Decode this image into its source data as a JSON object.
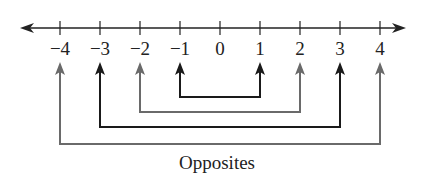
{
  "diagram": {
    "title": "",
    "number_line": {
      "ticks": [
        "−4",
        "−3",
        "−2",
        "−1",
        "0",
        "1",
        "2",
        "3",
        "4"
      ],
      "direction": "both"
    },
    "pairs": [
      {
        "a": "−1",
        "b": "1",
        "color": "#1a1a1a"
      },
      {
        "a": "−2",
        "b": "2",
        "color": "#6a6a6a"
      },
      {
        "a": "−3",
        "b": "3",
        "color": "#1a1a1a"
      },
      {
        "a": "−4",
        "b": "4",
        "color": "#6a6a6a"
      }
    ],
    "caption": "Opposites"
  }
}
